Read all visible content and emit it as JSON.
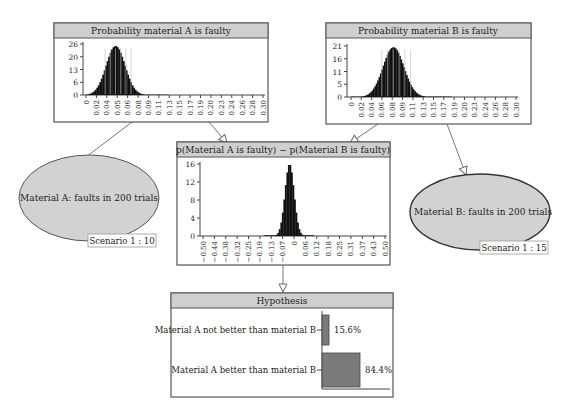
{
  "colors": {
    "title_bar": "#cfcfcf",
    "panel_border": "#555555",
    "node_fill": "#d2d2d2",
    "bar_fill": "#7a7a7a",
    "histogram": "#111111"
  },
  "panels": {
    "prob_a": {
      "title": "Probability material A is faulty",
      "y_ticks": [
        "26",
        "20",
        "13",
        "6",
        "0"
      ],
      "y_max": 26,
      "x_ticks": [
        "0",
        "0.02",
        "0.04",
        "0.05",
        "0.06",
        "0.08",
        "0.09",
        "0.11",
        "0.13",
        "0.15",
        "0.17",
        "0.19",
        "0.20",
        "0.23",
        "0.24",
        "0.26",
        "0.28",
        "0.30"
      ],
      "x_range": [
        0,
        0.3
      ],
      "distribution": {
        "mean": 0.05,
        "sd": 0.016,
        "peak": 25
      }
    },
    "prob_b": {
      "title": "Probability material B is faulty",
      "y_ticks": [
        "21",
        "16",
        "11",
        "5",
        "0"
      ],
      "y_max": 21,
      "x_ticks": [
        "0",
        "0.02",
        "0.04",
        "0.06",
        "0.08",
        "0.09",
        "0.11",
        "0.13",
        "0.15",
        "0.17",
        "0.19",
        "0.20",
        "0.23",
        "0.24",
        "0.26",
        "0.28",
        "0.30"
      ],
      "x_range": [
        0,
        0.3
      ],
      "distribution": {
        "mean": 0.077,
        "sd": 0.019,
        "peak": 20.5
      }
    },
    "diff": {
      "title": "p(Material A is faulty) − p(Material B is faulty)",
      "y_ticks": [
        "16",
        "12",
        "8",
        "4",
        "0"
      ],
      "y_max": 16,
      "x_ticks": [
        "−0.50",
        "−0.44",
        "−0.38",
        "−0.32",
        "−0.25",
        "−0.19",
        "−0.13",
        "−0.07",
        "0",
        "0.06",
        "0.12",
        "0.18",
        "0.25",
        "0.31",
        "0.37",
        "0.43",
        "0.50"
      ],
      "x_range": [
        -0.5,
        0.5
      ],
      "distribution": {
        "mean": -0.025,
        "sd": 0.025,
        "peak": 16
      }
    },
    "hypothesis": {
      "title": "Hypothesis",
      "rows": [
        {
          "label": "Material A not better than material B",
          "value": 15.6,
          "display": "15.6%"
        },
        {
          "label": "Material A better than material B",
          "value": 84.4,
          "display": "84.4%"
        }
      ]
    }
  },
  "nodes": {
    "material_a": {
      "label": "Material A: faults in 200 trials",
      "scenario": "Scenario 1 : 10"
    },
    "material_b": {
      "label": "Material B: faults in 200 trials",
      "scenario": "Scenario 1 : 15"
    }
  }
}
